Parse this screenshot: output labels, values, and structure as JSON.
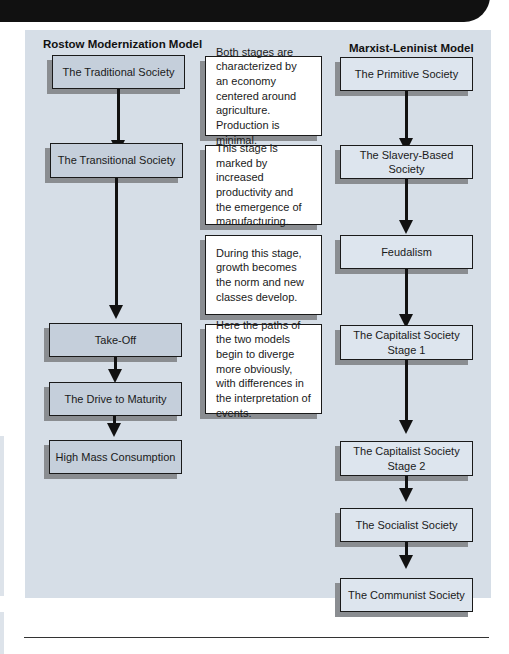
{
  "diagram": {
    "left_model": {
      "title": "Rostow Modernization Model",
      "stages": [
        "The Traditional Society",
        "The Transitional Society",
        "Take-Off",
        "The Drive to Maturity",
        "High Mass Consumption"
      ]
    },
    "right_model": {
      "title": "Marxist-Leninist Model",
      "stages": [
        "The Primitive Society",
        "The Slavery-Based Society",
        "Feudalism",
        "The Capitalist Society Stage 1",
        "The Capitalist Society Stage 2",
        "The Socialist Society",
        "The Communist Society"
      ],
      "stage_lines": {
        "cap1_line1": "The Capitalist Society",
        "cap1_line2": "Stage 1",
        "cap2_line1": "The Capitalist Society",
        "cap2_line2": "Stage 2"
      }
    },
    "notes": [
      "Both stages are characterized by an economy centered around agriculture. Production is minimal.",
      "This stage is marked by increased productivity and the emergence of manufacturing.",
      "During this stage, growth becomes the norm and new classes develop.",
      "Here the paths of the two models begin to diverge more obviously, with differences in the interpretation of events."
    ],
    "colors": {
      "panel_background": "#d6dee7",
      "rostow_box": "#c5cfdb",
      "marxist_box": "#dde5ee",
      "note_box": "#ffffff",
      "shadow": "#8a8d91",
      "arrow": "#111111"
    }
  }
}
